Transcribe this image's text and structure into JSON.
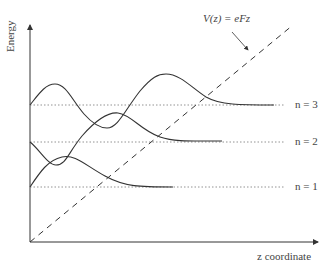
{
  "diagram": {
    "y_axis_label": "Energy",
    "x_axis_label": "z coordinate",
    "potential_label": "V(z) = eFz",
    "levels": [
      {
        "label": "n = 3",
        "y": 105
      },
      {
        "label": "n = 2",
        "y": 142
      },
      {
        "label": "n = 1",
        "y": 187
      }
    ],
    "colors": {
      "line": "#333333",
      "dotted": "#777777",
      "background": "#ffffff"
    }
  }
}
